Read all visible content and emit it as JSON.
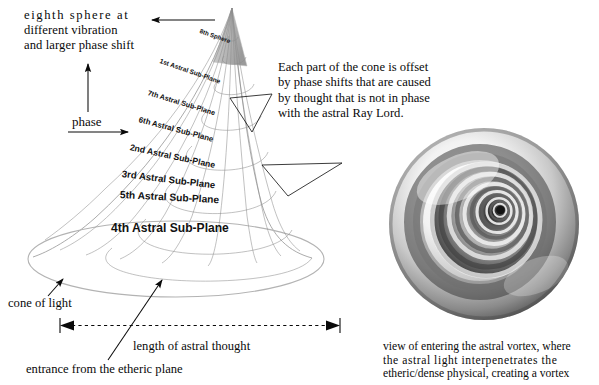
{
  "diagram": {
    "title_visible": false,
    "background_color": "#ffffff",
    "ink_color": "#111111",
    "mesh_color": "#8d8d8d"
  },
  "annotations": {
    "heading": {
      "line1": "eighth sphere at",
      "line2": "different vibration",
      "line3": "and larger phase shift"
    },
    "phase_label": "phase",
    "note": {
      "line1": "Each part of the cone is offset",
      "line2": "by phase shifts that are caused",
      "line3": "by thought that is not in phase",
      "line4": "with the astral Ray Lord."
    },
    "cone_of_light": "cone of light",
    "length_of_astral_thought": "length of astral thought",
    "entrance_from_etheric_plane": "entrance from the etheric plane",
    "vortex_caption": {
      "line1": "view of entering the astral vortex, where",
      "line2": "the astral light interpenetrates the",
      "line3": "etheric/dense physical, creating a vortex"
    }
  },
  "cone_labels": [
    {
      "text": "8th Sphere",
      "x": 200,
      "y": 27,
      "rotate": 19,
      "size": 6.2
    },
    {
      "text": "1st Astral Sub-Plane",
      "x": 160,
      "y": 57,
      "rotate": 19,
      "size": 6.6
    },
    {
      "text": "7th Astral Sub-Plane",
      "x": 148,
      "y": 88,
      "rotate": 17,
      "size": 7.2
    },
    {
      "text": "6th Astral Sub-Plane",
      "x": 139,
      "y": 115,
      "rotate": 15,
      "size": 7.9
    },
    {
      "text": "2nd Astral Sub-Plane",
      "x": 130,
      "y": 142,
      "rotate": 12,
      "size": 8.7
    },
    {
      "text": "3rd Astral Sub-Plane",
      "x": 122,
      "y": 168,
      "rotate": 7,
      "size": 9.6
    },
    {
      "text": "5th Astral Sub-Plane",
      "x": 120,
      "y": 189,
      "rotate": 3,
      "size": 10.2
    },
    {
      "text": "4th Astral Sub-Plane",
      "x": 111,
      "y": 221,
      "rotate": 0,
      "size": 12.1
    }
  ],
  "chart_data": {
    "type": "diagram",
    "elements": [
      "cone-mesh",
      "cone-base-ellipse",
      "cone-apex",
      "vortex-spiral",
      "dimension-line",
      "leader-arrows"
    ],
    "cone": {
      "apex": [
        232,
        8
      ],
      "base_center": [
        176,
        259
      ],
      "base_rx": 148,
      "base_ry": 38,
      "rings": 8,
      "ribs": 9
    },
    "vortex": {
      "center": [
        484,
        224
      ],
      "outer_radius": 98,
      "spiral_turns": 7,
      "core": [
        500,
        210
      ]
    },
    "dimension_line": {
      "x1": 60,
      "x2": 340,
      "y": 325,
      "label": "length of astral thought"
    }
  }
}
